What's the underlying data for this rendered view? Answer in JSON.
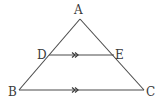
{
  "diagram": {
    "type": "geometry-triangle",
    "points": {
      "A": {
        "label": "A",
        "x": 80,
        "y": 19
      },
      "B": {
        "label": "B",
        "x": 19,
        "y": 90
      },
      "C": {
        "label": "C",
        "x": 144,
        "y": 90
      },
      "D": {
        "label": "D",
        "x": 49,
        "y": 55
      },
      "E": {
        "label": "E",
        "x": 114,
        "y": 55
      }
    },
    "segments": [
      "AB",
      "AC",
      "BC",
      "DE"
    ],
    "parallel_marks": [
      {
        "segment": "DE",
        "marker": ">>"
      },
      {
        "segment": "BC",
        "marker": ">>"
      }
    ],
    "colors": {
      "line": "#4a4a4a",
      "text": "#3a3a3a",
      "background": "#ffffff"
    }
  }
}
